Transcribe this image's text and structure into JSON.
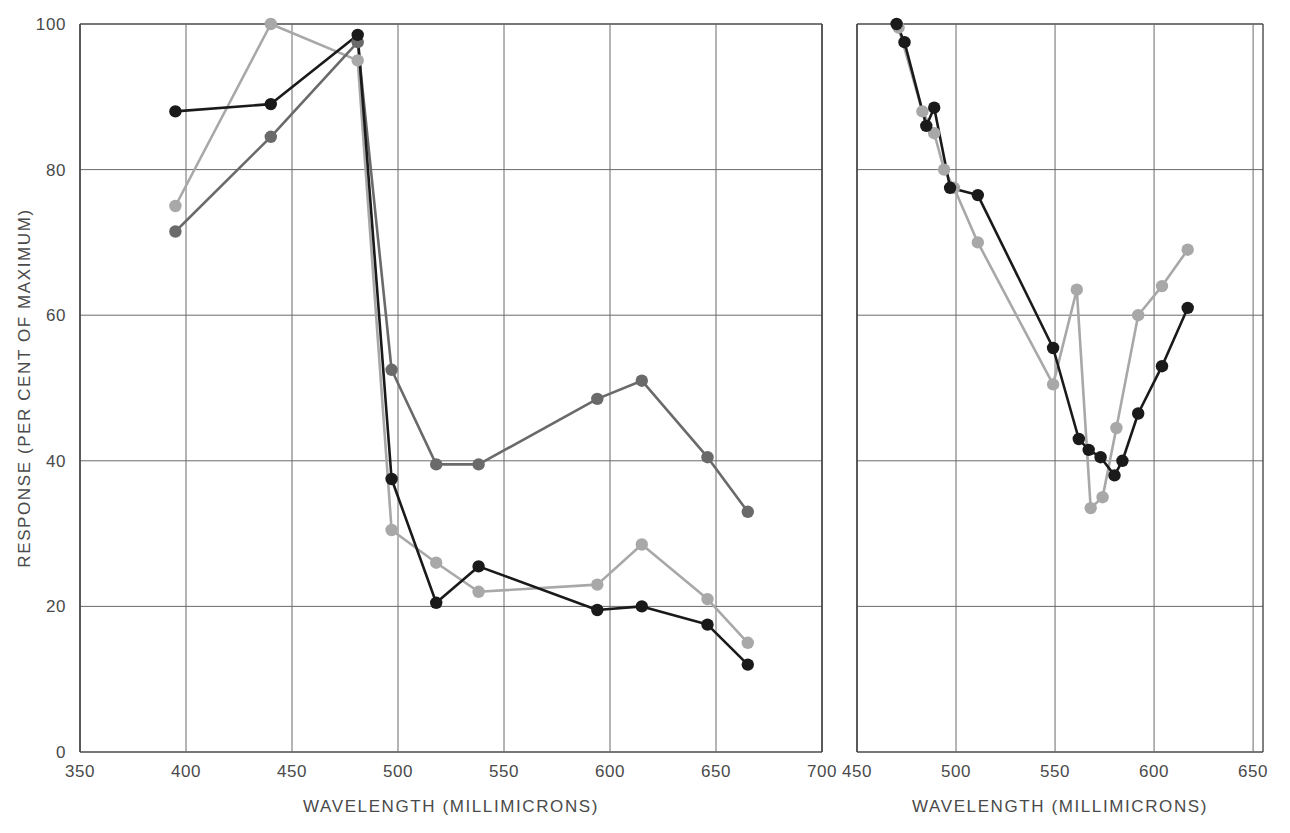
{
  "figure": {
    "background_color": "#ffffff",
    "panel_count": 2
  },
  "axes": {
    "y_label": "RESPONSE (PER CENT OF MAXIMUM)",
    "y_ticks": [
      0,
      20,
      40,
      60,
      80,
      100
    ],
    "x_label": "WAVELENGTH  (MILLIMICRONS)"
  },
  "colors": {
    "black": "#1a1a1a",
    "dark_gray": "#6a6a6a",
    "light_gray": "#a8a8a8",
    "axis": "#4a4a4a",
    "grid": "#6b6b6b"
  },
  "chart_data": [
    {
      "type": "line",
      "panel": "left",
      "title": "",
      "xlabel": "WAVELENGTH  (MILLIMICRONS)",
      "ylabel": "RESPONSE (PER CENT OF MAXIMUM)",
      "xlim": [
        350,
        700
      ],
      "ylim": [
        0,
        100
      ],
      "xticks": [
        350,
        400,
        450,
        500,
        550,
        600,
        650,
        700
      ],
      "yticks": [
        0,
        20,
        40,
        60,
        80,
        100
      ],
      "grid": true,
      "legend": "none",
      "series": [
        {
          "name": "black",
          "color": "#1a1a1a",
          "x": [
            395,
            440,
            481,
            497,
            518,
            538,
            594,
            615,
            646,
            665
          ],
          "y": [
            88.0,
            89.0,
            98.5,
            37.5,
            20.5,
            25.5,
            19.5,
            20.0,
            17.5,
            12.0
          ]
        },
        {
          "name": "dark-gray",
          "color": "#6a6a6a",
          "x": [
            395,
            440,
            481,
            497,
            518,
            538,
            594,
            615,
            646,
            665
          ],
          "y": [
            71.5,
            84.5,
            97.5,
            52.5,
            39.5,
            39.5,
            48.5,
            51.0,
            40.5,
            33.0
          ]
        },
        {
          "name": "light-gray",
          "color": "#a8a8a8",
          "x": [
            395,
            440,
            481,
            497,
            518,
            538,
            594,
            615,
            646,
            665
          ],
          "y": [
            75.0,
            100.0,
            95.0,
            30.5,
            26.0,
            22.0,
            23.0,
            28.5,
            21.0,
            15.0
          ]
        }
      ]
    },
    {
      "type": "line",
      "panel": "right",
      "title": "",
      "xlabel": "WAVELENGTH  (MILLIMICRONS)",
      "ylabel": "",
      "xlim": [
        450,
        655
      ],
      "ylim": [
        0,
        100
      ],
      "xticks": [
        450,
        500,
        550,
        600,
        650
      ],
      "yticks": [
        0,
        20,
        40,
        60,
        80,
        100
      ],
      "grid": true,
      "legend": "none",
      "series": [
        {
          "name": "black",
          "color": "#1a1a1a",
          "x": [
            470,
            474,
            485,
            489,
            497,
            511,
            549,
            562,
            567,
            573,
            580,
            584,
            592,
            604,
            617
          ],
          "y": [
            100.0,
            97.5,
            86.0,
            88.5,
            77.5,
            76.5,
            55.5,
            43.0,
            41.5,
            40.5,
            38.0,
            40.0,
            46.5,
            53.0,
            61.0
          ]
        },
        {
          "name": "light-gray",
          "color": "#a8a8a8",
          "x": [
            471,
            483,
            489,
            494,
            499,
            511,
            549,
            561,
            568,
            574,
            581,
            592,
            604,
            617
          ],
          "y": [
            99.5,
            88.0,
            85.0,
            80.0,
            77.5,
            70.0,
            50.5,
            63.5,
            33.5,
            35.0,
            44.5,
            60.0,
            64.0,
            69.0
          ]
        }
      ]
    }
  ]
}
